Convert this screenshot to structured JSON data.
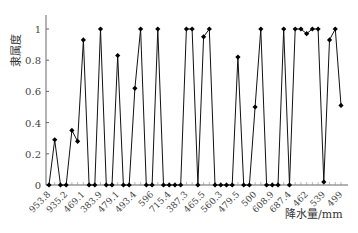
{
  "chart_data": {
    "type": "line",
    "title": "",
    "ylabel": "隶属度",
    "xlabel": "降水量/mm",
    "ylim": [
      0,
      1
    ],
    "yticks": [
      "0",
      "0.2",
      "0.4",
      "0.6",
      "0.8",
      "1"
    ],
    "xtick_labels": [
      "953.8",
      "935.2",
      "469.1",
      "383.9",
      "479.1",
      "493.4",
      "596",
      "715.4",
      "387.3",
      "465.5",
      "560.3",
      "479.5",
      "500",
      "608.9",
      "687.4",
      "462",
      "539",
      "499"
    ],
    "xtick_every": 3,
    "grid": false,
    "series": [
      {
        "name": "隶属度",
        "values": [
          0,
          0.29,
          0,
          0,
          0.35,
          0.28,
          0.93,
          0,
          0,
          1,
          0,
          0,
          0.83,
          0,
          0,
          0.62,
          1,
          0,
          0,
          1,
          0,
          0,
          0,
          0,
          1,
          1,
          0,
          0.95,
          1,
          0,
          0,
          0,
          0,
          0.82,
          0,
          0,
          0.5,
          1,
          0,
          0,
          0,
          1,
          0,
          1,
          1,
          0.97,
          1,
          1,
          0.02,
          0.93,
          1,
          0.51
        ]
      }
    ]
  },
  "axes": {
    "ylabel": "隶属度",
    "xlabel": "降水量/mm"
  }
}
